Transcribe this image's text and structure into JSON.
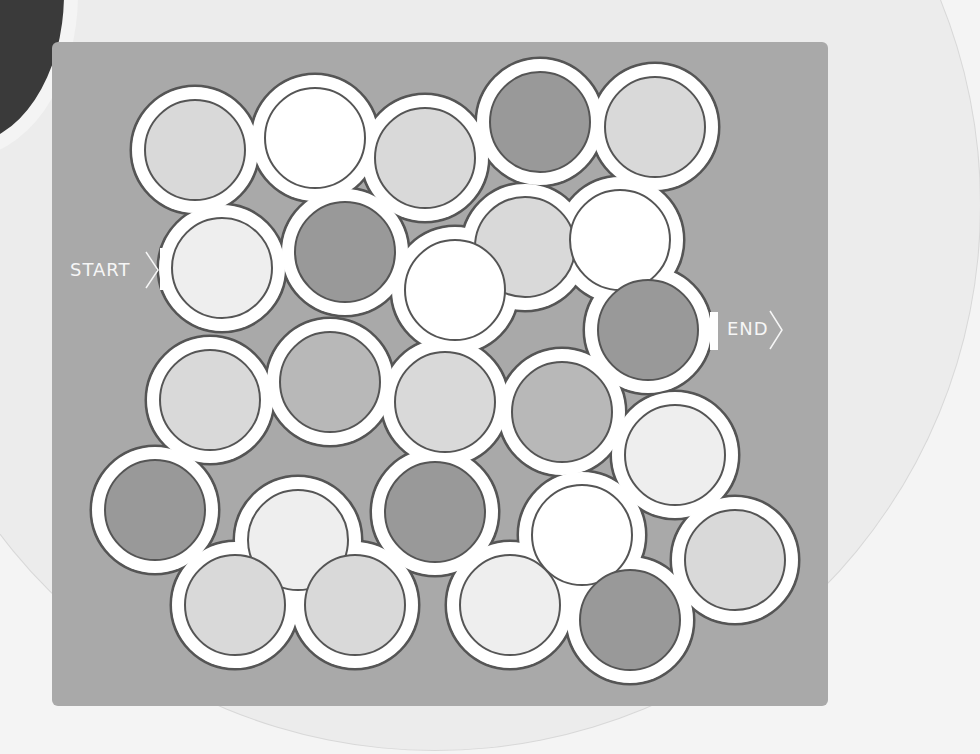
{
  "puzzle": {
    "type": "circle maze",
    "start_label": "START",
    "end_label": "END",
    "colors": {
      "page_bg": "#f4f4f4",
      "bg_circle": "#ececec",
      "panel": "#a9a9a9",
      "ring": "#ffffff",
      "outline": "#555555",
      "fills": {
        "white": "#ffffff",
        "lightest": "#eeeeee",
        "light": "#d9d9d9",
        "mid": "#b8b8b8",
        "dark": "#999999"
      }
    },
    "circles": [
      {
        "cx": 195,
        "cy": 150,
        "fill": "light"
      },
      {
        "cx": 315,
        "cy": 138,
        "fill": "white"
      },
      {
        "cx": 425,
        "cy": 158,
        "fill": "light"
      },
      {
        "cx": 540,
        "cy": 122,
        "fill": "dark"
      },
      {
        "cx": 655,
        "cy": 127,
        "fill": "light"
      },
      {
        "cx": 222,
        "cy": 268,
        "fill": "lightest"
      },
      {
        "cx": 345,
        "cy": 252,
        "fill": "dark"
      },
      {
        "cx": 525,
        "cy": 247,
        "fill": "light"
      },
      {
        "cx": 620,
        "cy": 240,
        "fill": "white"
      },
      {
        "cx": 455,
        "cy": 290,
        "fill": "white"
      },
      {
        "cx": 648,
        "cy": 330,
        "fill": "dark"
      },
      {
        "cx": 210,
        "cy": 400,
        "fill": "light"
      },
      {
        "cx": 330,
        "cy": 382,
        "fill": "mid"
      },
      {
        "cx": 445,
        "cy": 402,
        "fill": "light"
      },
      {
        "cx": 562,
        "cy": 412,
        "fill": "mid"
      },
      {
        "cx": 675,
        "cy": 455,
        "fill": "lightest"
      },
      {
        "cx": 155,
        "cy": 510,
        "fill": "dark"
      },
      {
        "cx": 298,
        "cy": 540,
        "fill": "lightest"
      },
      {
        "cx": 435,
        "cy": 512,
        "fill": "dark"
      },
      {
        "cx": 582,
        "cy": 535,
        "fill": "white"
      },
      {
        "cx": 735,
        "cy": 560,
        "fill": "light"
      },
      {
        "cx": 235,
        "cy": 605,
        "fill": "light"
      },
      {
        "cx": 355,
        "cy": 605,
        "fill": "light"
      },
      {
        "cx": 510,
        "cy": 605,
        "fill": "lightest"
      },
      {
        "cx": 630,
        "cy": 620,
        "fill": "dark"
      }
    ],
    "outer_radius": 64,
    "inner_radius": 50
  }
}
